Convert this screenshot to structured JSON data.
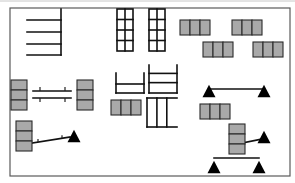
{
  "diagram": {
    "type": "layout-schematic",
    "colors": {
      "background": "#ffffff",
      "frame": "#5a5a5a",
      "line": "#111111",
      "box_fill": "#a9a9a9",
      "box_stroke": "#2b2b2b",
      "triangle": "#000000"
    },
    "frame": {
      "x": 10,
      "y": 8,
      "w": 280,
      "h": 168
    },
    "shelf_comb": {
      "spine_x": 61,
      "y_top": 9,
      "y_bottom": 55,
      "x_left": 27,
      "rungs_y": [
        20,
        32,
        44,
        55
      ]
    },
    "grid_racks": [
      {
        "x": 117,
        "y": 9,
        "w": 16,
        "h": 42,
        "cols": 2,
        "rows": 4
      },
      {
        "x": 149,
        "y": 9,
        "w": 16,
        "h": 42,
        "cols": 2,
        "rows": 4
      }
    ],
    "gray_box_groups": [
      {
        "x": 180,
        "y": 20,
        "cell_w": 10,
        "cell_h": 15,
        "count": 3,
        "orientation": "horizontal"
      },
      {
        "x": 232,
        "y": 20,
        "cell_w": 10,
        "cell_h": 15,
        "count": 3,
        "orientation": "horizontal"
      },
      {
        "x": 203,
        "y": 42,
        "cell_w": 10,
        "cell_h": 15,
        "count": 3,
        "orientation": "horizontal"
      },
      {
        "x": 253,
        "y": 42,
        "cell_w": 10,
        "cell_h": 15,
        "count": 3,
        "orientation": "horizontal"
      },
      {
        "x": 11,
        "y": 80,
        "cell_w": 16,
        "cell_h": 10,
        "count": 3,
        "orientation": "vertical"
      },
      {
        "x": 77,
        "y": 80,
        "cell_w": 16,
        "cell_h": 10,
        "count": 3,
        "orientation": "vertical"
      },
      {
        "x": 111,
        "y": 100,
        "cell_w": 10,
        "cell_h": 15,
        "count": 3,
        "orientation": "horizontal"
      },
      {
        "x": 200,
        "y": 104,
        "cell_w": 10,
        "cell_h": 15,
        "count": 3,
        "orientation": "horizontal"
      },
      {
        "x": 16,
        "y": 121,
        "cell_w": 16,
        "cell_h": 10,
        "count": 3,
        "orientation": "vertical"
      },
      {
        "x": 229,
        "y": 124,
        "cell_w": 16,
        "cell_h": 10,
        "count": 3,
        "orientation": "vertical"
      }
    ],
    "double_bar": {
      "x1": 33,
      "x2": 71,
      "y1": 91,
      "y2": 98,
      "ticks_x": [
        40,
        65
      ]
    },
    "small_frames": [
      {
        "x": 116,
        "y": 73,
        "w": 28,
        "h": 20,
        "shape": "u-with-rung"
      },
      {
        "x": 149,
        "y": 65,
        "w": 28,
        "h": 28,
        "shape": "u-with-two-rungs"
      },
      {
        "x": 147,
        "y": 98,
        "w": 30,
        "h": 29,
        "shape": "comb-down"
      }
    ],
    "triangles": [
      {
        "cx": 209,
        "cy": 91,
        "size": 13
      },
      {
        "cx": 264,
        "cy": 91,
        "size": 13
      },
      {
        "cx": 74,
        "cy": 136,
        "size": 13
      },
      {
        "cx": 264,
        "cy": 137,
        "size": 13
      },
      {
        "cx": 214,
        "cy": 167,
        "size": 13
      },
      {
        "cx": 259,
        "cy": 167,
        "size": 13
      }
    ],
    "connectors": [
      {
        "from": [
          209,
          89
        ],
        "to": [
          264,
          89
        ],
        "label": "tri-pair-top"
      },
      {
        "from": [
          32,
          143
        ],
        "to": [
          70,
          137
        ],
        "label": "box-to-triangle-left",
        "ticks_x": [
          38,
          62
        ]
      },
      {
        "from": [
          237,
          144
        ],
        "to": [
          262,
          139
        ],
        "label": "box-to-triangle-right"
      },
      {
        "from": [
          214,
          158
        ],
        "to": [
          259,
          158
        ],
        "label": "tri-pair-bottom-bar"
      }
    ]
  }
}
